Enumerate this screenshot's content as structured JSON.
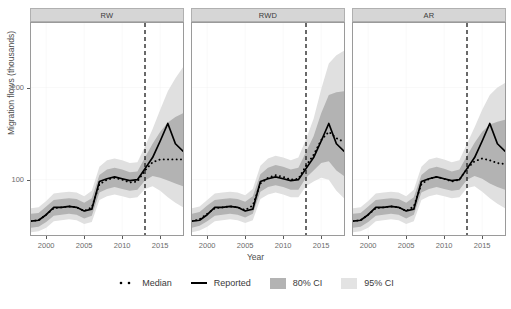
{
  "chart_data": {
    "type": "line",
    "title": "",
    "xlabel": "Year",
    "ylabel": "Migration flows (thousands)",
    "xlim": [
      1998,
      2018
    ],
    "ylim": [
      40,
      270
    ],
    "xticks": [
      2000,
      2005,
      2010,
      2015
    ],
    "yticks": [
      100,
      200
    ],
    "grid": true,
    "legend_position": "bottom",
    "annotations": [
      {
        "type": "vline",
        "x": 2013,
        "style": "dashed",
        "color": "#1a1a1a"
      }
    ],
    "facets": [
      {
        "label": "RW",
        "x": [
          1998,
          1999,
          2000,
          2001,
          2002,
          2003,
          2004,
          2005,
          2006,
          2007,
          2008,
          2009,
          2010,
          2011,
          2012,
          2013,
          2014,
          2015,
          2016,
          2017,
          2018
        ],
        "series": [
          {
            "name": "Reported",
            "style": "solid",
            "color": "#000000",
            "values": [
              55,
              56,
              62,
              70,
              70,
              71,
              70,
              66,
              68,
              98,
              101,
              103,
              101,
              99,
              100,
              112,
              124,
              142,
              161,
              139,
              131
            ]
          },
          {
            "name": "Median",
            "style": "dotted",
            "color": "#000000",
            "values": [
              55,
              56,
              62,
              69,
              70,
              71,
              70,
              66,
              70,
              95,
              100,
              102,
              100,
              97,
              98,
              110,
              119,
              122,
              122,
              122,
              122
            ]
          }
        ],
        "bands": [
          {
            "name": "80% CI",
            "color": "#b3b3b3",
            "lower": [
              48,
              49,
              54,
              61,
              62,
              63,
              62,
              58,
              61,
              86,
              90,
              92,
              90,
              88,
              89,
              99,
              104,
              102,
              99,
              96,
              93
            ],
            "upper": [
              63,
              64,
              71,
              78,
              79,
              80,
              79,
              75,
              80,
              105,
              111,
              113,
              111,
              108,
              109,
              124,
              139,
              152,
              162,
              168,
              172
            ]
          },
          {
            "name": "95% CI",
            "color": "#e0e0e0",
            "lower": [
              43,
              44,
              48,
              55,
              56,
              57,
              56,
              52,
              54,
              78,
              82,
              84,
              82,
              80,
              81,
              90,
              93,
              88,
              81,
              75,
              70
            ],
            "upper": [
              69,
              70,
              77,
              85,
              86,
              87,
              86,
              82,
              88,
              114,
              121,
              123,
              121,
              118,
              119,
              136,
              155,
              176,
              196,
              210,
              222
            ]
          }
        ]
      },
      {
        "label": "RWD",
        "x": [
          1998,
          1999,
          2000,
          2001,
          2002,
          2003,
          2004,
          2005,
          2006,
          2007,
          2008,
          2009,
          2010,
          2011,
          2012,
          2013,
          2014,
          2015,
          2016,
          2017,
          2018
        ],
        "series": [
          {
            "name": "Reported",
            "style": "solid",
            "color": "#000000",
            "values": [
              55,
              56,
              62,
              70,
              70,
              71,
              70,
              66,
              68,
              98,
              101,
              103,
              101,
              99,
              100,
              112,
              124,
              142,
              161,
              139,
              131
            ]
          },
          {
            "name": "Median",
            "style": "dotted",
            "color": "#000000",
            "values": [
              55,
              57,
              63,
              69,
              70,
              71,
              70,
              67,
              72,
              96,
              102,
              105,
              103,
              100,
              101,
              115,
              127,
              143,
              152,
              145,
              141
            ]
          }
        ],
        "bands": [
          {
            "name": "80% CI",
            "color": "#b3b3b3",
            "lower": [
              48,
              50,
              55,
              61,
              62,
              63,
              62,
              59,
              63,
              87,
              92,
              94,
              92,
              89,
              89,
              102,
              110,
              118,
              120,
              110,
              104
            ],
            "upper": [
              63,
              65,
              72,
              78,
              79,
              80,
              79,
              76,
              82,
              106,
              113,
              116,
              114,
              111,
              113,
              130,
              147,
              172,
              192,
              195,
              196
            ]
          },
          {
            "name": "95% CI",
            "color": "#e0e0e0",
            "lower": [
              43,
              45,
              49,
              55,
              56,
              57,
              56,
              53,
              56,
              79,
              84,
              86,
              84,
              81,
              81,
              93,
              98,
              102,
              100,
              88,
              80
            ],
            "upper": [
              69,
              71,
              78,
              85,
              86,
              87,
              86,
              83,
              90,
              115,
              123,
              126,
              124,
              121,
              124,
              144,
              166,
              198,
              226,
              235,
              240
            ]
          }
        ]
      },
      {
        "label": "AR",
        "x": [
          1998,
          1999,
          2000,
          2001,
          2002,
          2003,
          2004,
          2005,
          2006,
          2007,
          2008,
          2009,
          2010,
          2011,
          2012,
          2013,
          2014,
          2015,
          2016,
          2017,
          2018
        ],
        "series": [
          {
            "name": "Reported",
            "style": "solid",
            "color": "#000000",
            "values": [
              55,
              56,
              62,
              70,
              70,
              71,
              70,
              66,
              68,
              98,
              101,
              103,
              101,
              99,
              100,
              112,
              124,
              142,
              161,
              139,
              131
            ]
          },
          {
            "name": "Median",
            "style": "dotted",
            "color": "#000000",
            "values": [
              55,
              56,
              62,
              69,
              70,
              71,
              70,
              66,
              71,
              95,
              101,
              103,
              101,
              98,
              100,
              112,
              120,
              123,
              121,
              118,
              117
            ]
          }
        ],
        "bands": [
          {
            "name": "80% CI",
            "color": "#b3b3b3",
            "lower": [
              48,
              49,
              54,
              61,
              62,
              63,
              62,
              58,
              62,
              86,
              90,
              92,
              90,
              88,
              89,
              100,
              104,
              101,
              96,
              92,
              89
            ],
            "upper": [
              63,
              64,
              71,
              78,
              79,
              80,
              79,
              75,
              81,
              105,
              112,
              114,
              112,
              109,
              111,
              126,
              140,
              152,
              160,
              163,
              165
            ]
          },
          {
            "name": "95% CI",
            "color": "#e0e0e0",
            "lower": [
              43,
              44,
              48,
              55,
              56,
              57,
              56,
              52,
              55,
              78,
              82,
              84,
              82,
              80,
              81,
              91,
              93,
              87,
              80,
              74,
              69
            ],
            "upper": [
              69,
              70,
              77,
              85,
              86,
              87,
              86,
              82,
              89,
              114,
              122,
              124,
              122,
              119,
              121,
              139,
              157,
              176,
              192,
              200,
              205
            ]
          }
        ]
      }
    ],
    "legend": [
      {
        "label": "Median",
        "key": "dotted-line"
      },
      {
        "label": "Reported",
        "key": "solid-line"
      },
      {
        "label": "80% CI",
        "key": "swatch",
        "color": "#b3b3b3"
      },
      {
        "label": "95% CI",
        "key": "swatch",
        "color": "#e3e3e3"
      }
    ]
  }
}
